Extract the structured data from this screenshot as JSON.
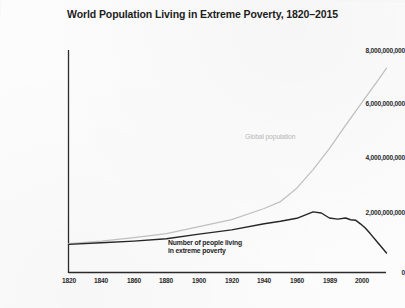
{
  "chart_data": {
    "type": "line",
    "title": "World Population Living in Extreme Poverty, 1820–2015",
    "xlabel": "",
    "ylabel": "",
    "xlim": [
      1820,
      2015
    ],
    "ylim": [
      0,
      8000000000
    ],
    "grid": false,
    "legend_position": "inline-annotations",
    "ytick_labels": [
      "0",
      "2,000,000,000",
      "4,000,000,000",
      "6,000,000,000",
      "8,000,000,000"
    ],
    "ytick_values": [
      0,
      2000000000,
      4000000000,
      6000000000,
      8000000000
    ],
    "xtick_labels": [
      "1820",
      "1840",
      "1860",
      "1880",
      "1900",
      "1920",
      "1940",
      "1960",
      "1989",
      "2000"
    ],
    "xtick_values": [
      1820,
      1840,
      1860,
      1880,
      1900,
      1920,
      1940,
      1960,
      1980,
      2000
    ],
    "series": [
      {
        "name": "Global population",
        "color": "#c2c2c2",
        "label_text": "Global population",
        "x": [
          1820,
          1840,
          1860,
          1880,
          1900,
          1920,
          1940,
          1950,
          1960,
          1970,
          1980,
          1990,
          2000,
          2010,
          2015
        ],
        "values": [
          1040000000,
          1130000000,
          1250000000,
          1400000000,
          1650000000,
          1900000000,
          2300000000,
          2550000000,
          3030000000,
          3700000000,
          4450000000,
          5300000000,
          6120000000,
          6930000000,
          7350000000
        ]
      },
      {
        "name": "Number of people living in extreme poverty",
        "color": "#262626",
        "label_text": "Number of people living\nin extreme poverty",
        "label_line_1": "Number of people living",
        "label_line_2": "in extreme poverty",
        "x": [
          1820,
          1840,
          1860,
          1880,
          1900,
          1920,
          1940,
          1950,
          1960,
          1970,
          1975,
          1980,
          1985,
          1990,
          1993,
          1996,
          1999,
          2002,
          2005,
          2010,
          2015
        ],
        "values": [
          1010000000,
          1070000000,
          1130000000,
          1210000000,
          1380000000,
          1530000000,
          1750000000,
          1840000000,
          1950000000,
          2180000000,
          2140000000,
          1960000000,
          1920000000,
          1960000000,
          1900000000,
          1880000000,
          1750000000,
          1600000000,
          1400000000,
          1050000000,
          700000000
        ]
      }
    ]
  }
}
